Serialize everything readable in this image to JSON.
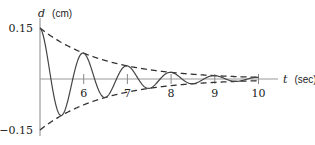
{
  "chart_data": {
    "type": "line",
    "title": "",
    "xlabel": {
      "var": "t",
      "unit": "(sec)"
    },
    "ylabel": {
      "var": "d",
      "unit": "(cm)"
    },
    "xlim": [
      5,
      10.4
    ],
    "ylim": [
      -0.15,
      0.15
    ],
    "x_ticks": [
      6,
      7,
      8,
      9,
      10
    ],
    "x_tick_labels": [
      "6",
      "7",
      "8",
      "9",
      "10"
    ],
    "y_ticks": [
      0.15,
      -0.15
    ],
    "y_tick_labels": [
      "0.15",
      "−0.15"
    ],
    "grid": false,
    "legend": null,
    "series": [
      {
        "name": "damped oscillation",
        "style": "solid",
        "formula": "d = 0.15 e^(-0.68(t-5)) cos(2π t)",
        "x": [
          5,
          5.5,
          6,
          6.5,
          7,
          7.5,
          8,
          8.5,
          9,
          9.5,
          10
        ],
        "values": [
          0.15,
          -0.107,
          0.076,
          -0.054,
          0.039,
          -0.027,
          0.019,
          -0.014,
          0.01,
          -0.007,
          0.005
        ]
      },
      {
        "name": "upper envelope",
        "style": "dashed",
        "formula": "d = 0.15 e^(-0.68(t-5))",
        "x": [
          5,
          6,
          7,
          8,
          9,
          10
        ],
        "values": [
          0.15,
          0.076,
          0.039,
          0.019,
          0.01,
          0.005
        ]
      },
      {
        "name": "lower envelope",
        "style": "dashed",
        "formula": "d = -0.15 e^(-0.68(t-5))",
        "x": [
          5,
          6,
          7,
          8,
          9,
          10
        ],
        "values": [
          -0.15,
          -0.076,
          -0.039,
          -0.019,
          -0.01,
          -0.005
        ]
      }
    ],
    "params": {
      "amplitude": 0.15,
      "decay": 0.68,
      "period": 1,
      "t0": 5
    },
    "colors": {
      "curve": "#333333",
      "axis": "#888888",
      "text": "#222222"
    }
  }
}
